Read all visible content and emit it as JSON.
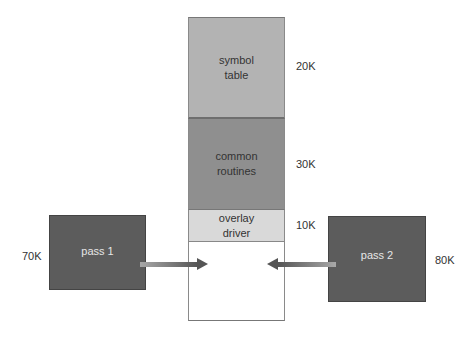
{
  "diagram": {
    "title": "",
    "memory_column": {
      "segments": [
        {
          "label_line1": "symbol",
          "label_line2": "table",
          "size": "20K",
          "fill": "#b3b3b3"
        },
        {
          "label_line1": "common",
          "label_line2": "routines",
          "size": "30K",
          "fill": "#8f8f8f"
        },
        {
          "label_line1": "overlay",
          "label_line2": "driver",
          "size": "10K",
          "fill": "#d9d9d9"
        },
        {
          "label_line1": "",
          "label_line2": "",
          "size": "",
          "fill": "#ffffff"
        }
      ]
    },
    "passes": [
      {
        "label": "pass 1",
        "size": "70K",
        "fill": "#5c5c5c",
        "arrow_direction": "right"
      },
      {
        "label": "pass 2",
        "size": "80K",
        "fill": "#5c5c5c",
        "arrow_direction": "left"
      }
    ]
  }
}
